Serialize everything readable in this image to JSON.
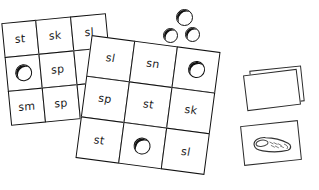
{
  "worksheet": {
    "title": "Phonics blend bingo boards with counters",
    "background_color": "#ffffff",
    "ink_color": "#111111"
  },
  "grids": [
    {
      "name": "left-bingo-grid",
      "rows": 3,
      "columns": 3,
      "rotation_deg": -5.5,
      "cells": [
        {
          "text": "st",
          "counter": false
        },
        {
          "text": "sk",
          "counter": false
        },
        {
          "text": "sl",
          "counter": false
        },
        {
          "text": "",
          "counter": true
        },
        {
          "text": "sp",
          "counter": false
        },
        {
          "text": "",
          "counter": false
        },
        {
          "text": "sm",
          "counter": false
        },
        {
          "text": "sp",
          "counter": false
        },
        {
          "text": "",
          "counter": false
        }
      ]
    },
    {
      "name": "right-bingo-grid",
      "rows": 3,
      "columns": 3,
      "rotation_deg": 7.5,
      "cells": [
        {
          "text": "sl",
          "counter": false
        },
        {
          "text": "sn",
          "counter": false
        },
        {
          "text": "",
          "counter": true
        },
        {
          "text": "sp",
          "counter": false
        },
        {
          "text": "st",
          "counter": false
        },
        {
          "text": "sk",
          "counter": false
        },
        {
          "text": "st",
          "counter": false
        },
        {
          "text": "",
          "counter": true
        },
        {
          "text": "sl",
          "counter": false
        }
      ]
    }
  ],
  "loose_counters": [
    {
      "name": "counter-top"
    },
    {
      "name": "counter-left"
    },
    {
      "name": "counter-right"
    }
  ],
  "card_stack": {
    "name": "blank-card-stack",
    "label": "",
    "count": 2
  },
  "picture_card": {
    "name": "slipper-picture-card",
    "image": "slipper-icon",
    "label": ""
  }
}
